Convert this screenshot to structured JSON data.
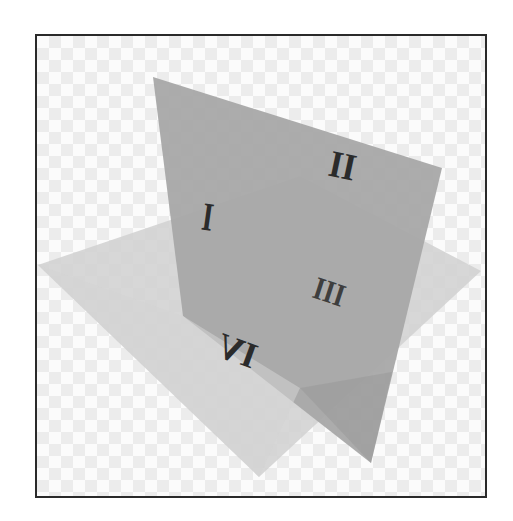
{
  "diagram": {
    "title": "",
    "colors": {
      "frame_border": "#2a2a2a",
      "checker_light": "#fbfbfb",
      "checker_dark": "#ececec",
      "vertical_plane": "#a6a6a6",
      "vertical_plane_lower": "#9a9a9a",
      "horizontal_plane": "#d2d2d2",
      "numeral": "#2b2b2b"
    },
    "planes": {
      "vertical": {
        "label": "vertical-plane",
        "points": "153,77 442,168 371,463 183,316"
      },
      "vertical_lower": {
        "label": "vertical-plane-below-horizontal",
        "points": "183,316 300,176 420,249 371,463"
      },
      "horizontal": {
        "label": "horizontal-plane",
        "points": "38,265 300,176 481,271 259,477"
      }
    },
    "quadrants": [
      {
        "label": "I",
        "x": 206,
        "y": 230,
        "rotate": 8,
        "size": 40,
        "scale_x": 0.7
      },
      {
        "label": "II",
        "x": 340,
        "y": 175,
        "rotate": 12,
        "size": 38,
        "scale_x": 0.9
      },
      {
        "label": "III",
        "x": 325,
        "y": 300,
        "rotate": 18,
        "size": 34,
        "scale_x": 0.85
      },
      {
        "label": "IV",
        "x": 233,
        "y": 370,
        "rotate": 200,
        "size": 36,
        "scale_x": 1.0
      }
    ]
  }
}
